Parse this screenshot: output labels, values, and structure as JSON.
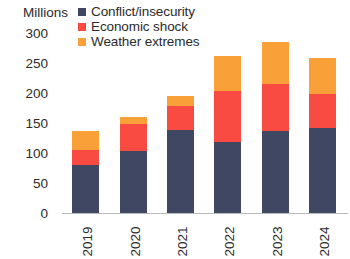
{
  "chart_data": {
    "type": "bar",
    "stacked": true,
    "title": "",
    "subtitle": "",
    "xlabel": "",
    "ylabel": "",
    "unit_label": "Millions",
    "categories": [
      "2019",
      "2020",
      "2021",
      "2022",
      "2023",
      "2024"
    ],
    "series": [
      {
        "name": "Conflict/insecurity",
        "color": "#3f4763",
        "values": [
          80,
          103,
          139,
          118,
          136,
          142
        ]
      },
      {
        "name": "Economic shock",
        "color": "#fa4b43",
        "values": [
          25,
          45,
          39,
          85,
          79,
          56
        ]
      },
      {
        "name": "Weather extremes",
        "color": "#f9a138",
        "values": [
          32,
          12,
          17,
          59,
          70,
          61
        ]
      }
    ],
    "totals": [
      137,
      160,
      195,
      262,
      285,
      259
    ],
    "ylim": [
      0,
      300
    ],
    "yticks": [
      0,
      50,
      100,
      150,
      200,
      250,
      300
    ],
    "ytick_labels": [
      "0",
      "50",
      "100",
      "150",
      "200",
      "250",
      "300"
    ],
    "grid": false,
    "legend_position": "top-left",
    "legend_entries": [
      "Conflict/insecurity",
      "Economic shock",
      "Weather extremes"
    ],
    "axis_color": "#b9b9b9",
    "text_color": "#2b2b2b",
    "background": "#ffffff"
  }
}
